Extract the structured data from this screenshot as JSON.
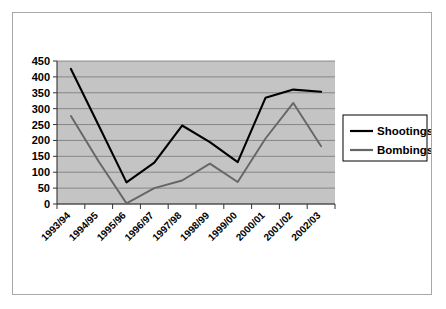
{
  "chart_data": {
    "type": "line",
    "title": "",
    "xlabel": "",
    "ylabel": "",
    "ylim": [
      0,
      450
    ],
    "yticks": [
      0,
      50,
      100,
      150,
      200,
      250,
      300,
      350,
      400,
      450
    ],
    "grid": true,
    "legend_position": "right",
    "categories": [
      "1993/94",
      "1994/95",
      "1995/96",
      "1996/97",
      "1997/98",
      "1998/99",
      "1999/00",
      "2000/01",
      "2001/02",
      "2002/03"
    ],
    "series": [
      {
        "name": "Shootings",
        "color": "#000000",
        "values": [
          425,
          247,
          68,
          130,
          247,
          195,
          132,
          334,
          360,
          353
        ]
      },
      {
        "name": "Bombings",
        "color": "#666666",
        "values": [
          277,
          134,
          2,
          50,
          74,
          127,
          69,
          206,
          318,
          182
        ]
      }
    ]
  },
  "legend": {
    "entries": [
      {
        "label": "Shootings",
        "color": "#000000"
      },
      {
        "label": "Bombings",
        "color": "#666666"
      }
    ]
  },
  "colors": {
    "plot_background": "#c4c4c4",
    "gridline": "#777777",
    "frame_border": "#a8a8a8",
    "shootings": "#000000",
    "bombings": "#666666"
  }
}
